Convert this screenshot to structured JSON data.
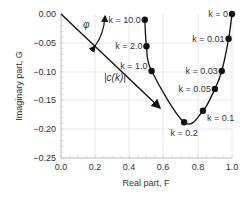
{
  "chart_data": {
    "type": "line",
    "title": "",
    "xlabel": "Real part, F",
    "ylabel": "Imaginary part, G",
    "xlim": [
      0.0,
      1.0
    ],
    "ylim": [
      -0.25,
      0.0
    ],
    "grid": true,
    "legend": "none",
    "x_ticks": [
      "0.0",
      "0.2",
      "0.4",
      "0.6",
      "0.8",
      "1.0"
    ],
    "y_ticks": [
      "0.00",
      "−0.05",
      "−0.10",
      "−0.15",
      "−0.20",
      "−0.25"
    ],
    "series": [
      {
        "name": "c(k)",
        "points": [
          {
            "k": "k = 0",
            "F": 1.0,
            "G": 0.0
          },
          {
            "k": "k = 0.01",
            "F": 0.98,
            "G": -0.043
          },
          {
            "k": "k = 0.03",
            "F": 0.94,
            "G": -0.099
          },
          {
            "k": "k = 0.05",
            "F": 0.9,
            "G": -0.13
          },
          {
            "k": "k = 0.1",
            "F": 0.83,
            "G": -0.168
          },
          {
            "k": "k = 0.2",
            "F": 0.72,
            "G": -0.188
          },
          {
            "k": "k = 1.0",
            "F": 0.53,
            "G": -0.099
          },
          {
            "k": "k = 2.0",
            "F": 0.5,
            "G": -0.056
          },
          {
            "k": "k = 10.0",
            "F": 0.49,
            "G": -0.01
          }
        ]
      }
    ],
    "annotations": [
      {
        "text": "φ",
        "type": "angle-arc"
      },
      {
        "text": "|c(k)|",
        "type": "vector-label"
      }
    ]
  }
}
